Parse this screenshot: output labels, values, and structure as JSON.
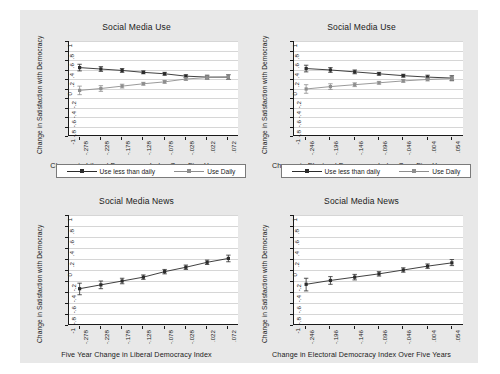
{
  "figure": {
    "background_color": "#e8e8e8",
    "panel_background_color": "#ffffff",
    "gridline_color": "#d6d6d6",
    "axis_color": "#1a1a1a",
    "series_colors": {
      "use_less_than_daily": "#2b2b2b",
      "use_daily": "#8e8e8e",
      "single": "#2b2b2b"
    }
  },
  "common": {
    "ylabel": "Change in Satisfaction with Democracy",
    "yticks": [
      "-1",
      "-.8",
      "-.6",
      "-.4",
      "-.2",
      "0",
      ".2",
      ".4",
      ".6",
      ".8",
      "1"
    ],
    "legend": {
      "items": [
        {
          "label": "Use less than daily",
          "marker": "filled-square",
          "color": "#2b2b2b"
        },
        {
          "label": "Use Daily",
          "marker": "hollow-square",
          "color": "#8e8e8e"
        }
      ]
    }
  },
  "panels": [
    {
      "id": "top-left",
      "title": "Social Media Use",
      "xlabel": "Change in Liberal Democracy Index Over Five Years",
      "has_legend": true,
      "chart_data": {
        "type": "line",
        "title": "Social Media Use",
        "xlabel": "Change in Liberal Democracy Index Over Five Years",
        "ylabel": "Change in Satisfaction with Democracy",
        "x": [
          -0.278,
          -0.228,
          -0.178,
          -0.128,
          -0.078,
          -0.028,
          0.022,
          0.072
        ],
        "xticklabels": [
          "-.278",
          "-.228",
          "-.178",
          "-.128",
          "-.078",
          "-.028",
          ".022",
          ".072"
        ],
        "ylim": [
          -1,
          1
        ],
        "xlim": [
          -0.303,
          0.097
        ],
        "grid": true,
        "legend_position": "below-axis",
        "series": [
          {
            "name": "Use less than daily",
            "values": [
              0.44,
              0.41,
              0.38,
              0.34,
              0.31,
              0.26,
              0.24,
              0.24
            ],
            "err_low": [
              0.37,
              0.36,
              0.34,
              0.31,
              0.28,
              0.23,
              0.2,
              0.19
            ],
            "err_high": [
              0.51,
              0.46,
              0.42,
              0.37,
              0.34,
              0.29,
              0.28,
              0.29
            ]
          },
          {
            "name": "Use Daily",
            "values": [
              -0.04,
              0.0,
              0.05,
              0.1,
              0.14,
              0.2,
              0.23,
              0.24
            ],
            "err_low": [
              -0.13,
              -0.06,
              0.01,
              0.07,
              0.11,
              0.17,
              0.19,
              0.19
            ],
            "err_high": [
              0.05,
              0.06,
              0.09,
              0.13,
              0.17,
              0.23,
              0.27,
              0.29
            ]
          }
        ]
      }
    },
    {
      "id": "top-right",
      "title": "Social Media Use",
      "xlabel": "Change in Electoral Democracy Index Over Five Years",
      "has_legend": true,
      "chart_data": {
        "type": "line",
        "title": "Social Media Use",
        "xlabel": "Change in Electoral Democracy Index Over Five Years",
        "ylabel": "Change in Satisfaction with Democracy",
        "x": [
          -0.246,
          -0.196,
          -0.146,
          -0.096,
          -0.046,
          0.004,
          0.054
        ],
        "xticklabels": [
          "-.246",
          "-.196",
          "-.146",
          "-.096",
          "-.046",
          ".004",
          ".054"
        ],
        "ylim": [
          -1,
          1
        ],
        "xlim": [
          -0.271,
          0.079
        ],
        "grid": true,
        "legend_position": "below-axis",
        "series": [
          {
            "name": "Use less than daily",
            "values": [
              0.42,
              0.39,
              0.35,
              0.31,
              0.27,
              0.24,
              0.22
            ],
            "err_low": [
              0.35,
              0.34,
              0.31,
              0.28,
              0.24,
              0.2,
              0.17
            ],
            "err_high": [
              0.49,
              0.44,
              0.39,
              0.34,
              0.3,
              0.28,
              0.27
            ]
          },
          {
            "name": "Use Daily",
            "values": [
              -0.01,
              0.04,
              0.08,
              0.12,
              0.16,
              0.19,
              0.21
            ],
            "err_low": [
              -0.1,
              -0.02,
              0.04,
              0.09,
              0.13,
              0.16,
              0.16
            ],
            "err_high": [
              0.08,
              0.1,
              0.12,
              0.15,
              0.19,
              0.22,
              0.26
            ]
          }
        ]
      }
    },
    {
      "id": "bottom-left",
      "title": "Social Media News",
      "xlabel": "Five Year Change in Liberal Democracy Index",
      "has_legend": false,
      "chart_data": {
        "type": "line",
        "title": "Social Media News",
        "xlabel": "Five Year Change in Liberal Democracy Index",
        "ylabel": "Change in Satisfaction with Democracy",
        "x": [
          -0.278,
          -0.228,
          -0.178,
          -0.128,
          -0.078,
          -0.028,
          0.022,
          0.072
        ],
        "xticklabels": [
          "-.278",
          "-.228",
          "-.178",
          "-.128",
          "-.078",
          "-.028",
          ".022",
          ".072"
        ],
        "ylim": [
          -1,
          1
        ],
        "xlim": [
          -0.303,
          0.097
        ],
        "grid": true,
        "legend_position": "none",
        "series": [
          {
            "name": "Social Media News",
            "values": [
              -0.34,
              -0.27,
              -0.2,
              -0.13,
              -0.03,
              0.05,
              0.14,
              0.21
            ],
            "err_low": [
              -0.45,
              -0.34,
              -0.25,
              -0.17,
              -0.07,
              0.01,
              0.1,
              0.15
            ],
            "err_high": [
              -0.24,
              -0.2,
              -0.15,
              -0.09,
              0.01,
              0.09,
              0.18,
              0.27
            ]
          }
        ]
      }
    },
    {
      "id": "bottom-right",
      "title": "Social Media News",
      "xlabel": "Change in Electoral Democracy Index Over Five Years",
      "has_legend": false,
      "chart_data": {
        "type": "line",
        "title": "Social Media News",
        "xlabel": "Change in Electoral Democracy Index Over Five Years",
        "ylabel": "Change in Satisfaction with Democracy",
        "x": [
          -0.246,
          -0.196,
          -0.146,
          -0.096,
          -0.046,
          0.004,
          0.054
        ],
        "xticklabels": [
          "-.246",
          "-.196",
          "-.146",
          "-.096",
          "-.046",
          ".004",
          ".054"
        ],
        "ylim": [
          -1,
          1
        ],
        "xlim": [
          -0.271,
          0.079
        ],
        "grid": true,
        "legend_position": "none",
        "series": [
          {
            "name": "Social Media News",
            "values": [
              -0.26,
              -0.19,
              -0.13,
              -0.07,
              0.0,
              0.07,
              0.13
            ],
            "err_low": [
              -0.38,
              -0.26,
              -0.18,
              -0.11,
              -0.04,
              0.03,
              0.08
            ],
            "err_high": [
              -0.15,
              -0.12,
              -0.08,
              -0.03,
              0.04,
              0.11,
              0.19
            ]
          }
        ]
      }
    }
  ]
}
